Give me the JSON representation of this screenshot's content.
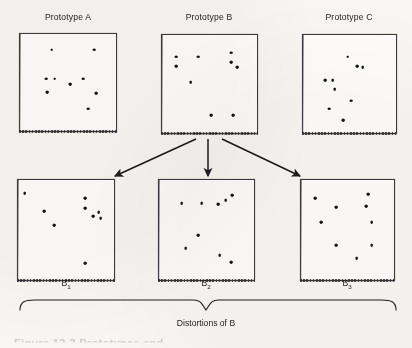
{
  "figure": {
    "bottom_caption": "Distortions of B",
    "cut_off_caption": "Figure 12-3  Prototypes and",
    "ink_color": "#141414",
    "background_color": "#f8f6f2"
  },
  "top_row": [
    {
      "title": "Prototype A",
      "box": {
        "x": 19,
        "y": 33,
        "w": 98,
        "h": 99
      },
      "title_pos": {
        "x": 68,
        "y": 18
      },
      "dots": [
        {
          "x": 33,
          "y": 16
        },
        {
          "x": 77,
          "y": 16
        },
        {
          "x": 27,
          "y": 46
        },
        {
          "x": 36,
          "y": 46
        },
        {
          "x": 52,
          "y": 52
        },
        {
          "x": 66,
          "y": 46
        },
        {
          "x": 28,
          "y": 60
        },
        {
          "x": 79,
          "y": 61
        },
        {
          "x": 71,
          "y": 77
        }
      ]
    },
    {
      "title": "Prototype B",
      "box": {
        "x": 161,
        "y": 34,
        "w": 97,
        "h": 100
      },
      "title_pos": {
        "x": 209,
        "y": 18
      },
      "dots": [
        {
          "x": 15,
          "y": 22
        },
        {
          "x": 15,
          "y": 32
        },
        {
          "x": 38,
          "y": 22
        },
        {
          "x": 73,
          "y": 18
        },
        {
          "x": 73,
          "y": 28
        },
        {
          "x": 79,
          "y": 33
        },
        {
          "x": 30,
          "y": 48
        },
        {
          "x": 52,
          "y": 82
        },
        {
          "x": 75,
          "y": 82
        }
      ]
    },
    {
      "title": "Prototype C",
      "box": {
        "x": 302,
        "y": 34,
        "w": 95,
        "h": 100
      },
      "title_pos": {
        "x": 349,
        "y": 18
      },
      "dots": [
        {
          "x": 48,
          "y": 22
        },
        {
          "x": 58,
          "y": 32
        },
        {
          "x": 64,
          "y": 33
        },
        {
          "x": 24,
          "y": 46
        },
        {
          "x": 32,
          "y": 46
        },
        {
          "x": 34,
          "y": 55
        },
        {
          "x": 52,
          "y": 67
        },
        {
          "x": 28,
          "y": 75
        },
        {
          "x": 43,
          "y": 87
        }
      ]
    }
  ],
  "bottom_row": [
    {
      "label": "B",
      "subscript": "1",
      "box": {
        "x": 17,
        "y": 179,
        "w": 98,
        "h": 102
      },
      "label_pos": {
        "x": 66,
        "y": 284
      },
      "dots": [
        {
          "x": 7,
          "y": 13
        },
        {
          "x": 70,
          "y": 18
        },
        {
          "x": 27,
          "y": 31
        },
        {
          "x": 70,
          "y": 28
        },
        {
          "x": 78,
          "y": 36
        },
        {
          "x": 84,
          "y": 32
        },
        {
          "x": 86,
          "y": 38
        },
        {
          "x": 38,
          "y": 45
        },
        {
          "x": 70,
          "y": 83
        }
      ]
    },
    {
      "label": "B",
      "subscript": "2",
      "box": {
        "x": 158,
        "y": 179,
        "w": 97,
        "h": 102
      },
      "label_pos": {
        "x": 206,
        "y": 284
      },
      "dots": [
        {
          "x": 24,
          "y": 23
        },
        {
          "x": 45,
          "y": 23
        },
        {
          "x": 62,
          "y": 24
        },
        {
          "x": 70,
          "y": 20
        },
        {
          "x": 77,
          "y": 15
        },
        {
          "x": 41,
          "y": 55
        },
        {
          "x": 28,
          "y": 68
        },
        {
          "x": 64,
          "y": 75
        },
        {
          "x": 76,
          "y": 82
        }
      ]
    },
    {
      "label": "B",
      "subscript": "3",
      "box": {
        "x": 300,
        "y": 179,
        "w": 95,
        "h": 102
      },
      "label_pos": {
        "x": 347,
        "y": 284
      },
      "dots": [
        {
          "x": 15,
          "y": 18
        },
        {
          "x": 72,
          "y": 14
        },
        {
          "x": 38,
          "y": 27
        },
        {
          "x": 70,
          "y": 26
        },
        {
          "x": 22,
          "y": 42
        },
        {
          "x": 76,
          "y": 42
        },
        {
          "x": 38,
          "y": 65
        },
        {
          "x": 76,
          "y": 65
        },
        {
          "x": 60,
          "y": 78
        }
      ]
    }
  ],
  "arrows": [
    {
      "name": "arrow-b-to-b1",
      "x1": 196,
      "y1": 139,
      "x2": 115,
      "y2": 176
    },
    {
      "name": "arrow-b-to-b2",
      "x1": 208,
      "y1": 139,
      "x2": 208,
      "y2": 176
    },
    {
      "name": "arrow-b-to-b3",
      "x1": 222,
      "y1": 139,
      "x2": 300,
      "y2": 176
    }
  ],
  "brace": {
    "left": 20,
    "right": 396,
    "top": 300,
    "mid_x": 206,
    "depth": 10
  }
}
